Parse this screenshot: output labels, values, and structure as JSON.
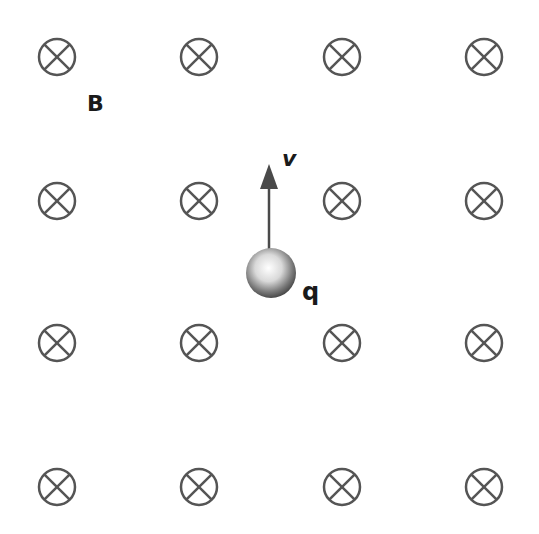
{
  "diagram": {
    "field_label": "B",
    "velocity_label": "v",
    "charge_label": "q",
    "field_symbol": "into-page (circle with cross)",
    "grid": {
      "columns_x": [
        57,
        199,
        342,
        484
      ],
      "rows_y": [
        57,
        201,
        343,
        487
      ],
      "symbol_radius": 18
    },
    "charge": {
      "cx": 271,
      "cy": 273,
      "r": 25
    },
    "velocity_arrow": {
      "x": 269,
      "y_start": 250,
      "y_end": 165,
      "direction": "up"
    },
    "colors": {
      "symbol": "#555555",
      "arrow": "#4a4a4a",
      "text": "#1a1a1a",
      "background": "#ffffff"
    }
  }
}
